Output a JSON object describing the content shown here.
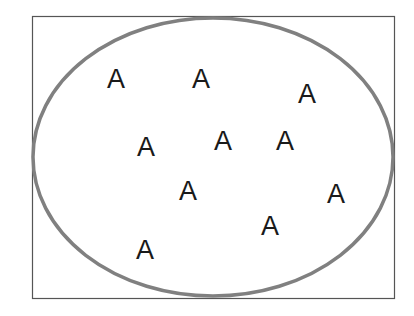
{
  "diagram": {
    "type": "set-diagram",
    "frame": {
      "x": 32,
      "y": 16,
      "width": 362,
      "height": 282,
      "stroke": "#555555"
    },
    "set": {
      "cx": 213,
      "cy": 157,
      "rx": 180,
      "ry": 139,
      "stroke": "#808080"
    },
    "elements": [
      {
        "label": "A",
        "x": 116,
        "y": 78
      },
      {
        "label": "A",
        "x": 201,
        "y": 78
      },
      {
        "label": "A",
        "x": 307,
        "y": 93
      },
      {
        "label": "A",
        "x": 146,
        "y": 146
      },
      {
        "label": "A",
        "x": 223,
        "y": 140
      },
      {
        "label": "A",
        "x": 285,
        "y": 140
      },
      {
        "label": "A",
        "x": 188,
        "y": 190
      },
      {
        "label": "A",
        "x": 336,
        "y": 193
      },
      {
        "label": "A",
        "x": 270,
        "y": 225
      },
      {
        "label": "A",
        "x": 145,
        "y": 249
      }
    ]
  }
}
